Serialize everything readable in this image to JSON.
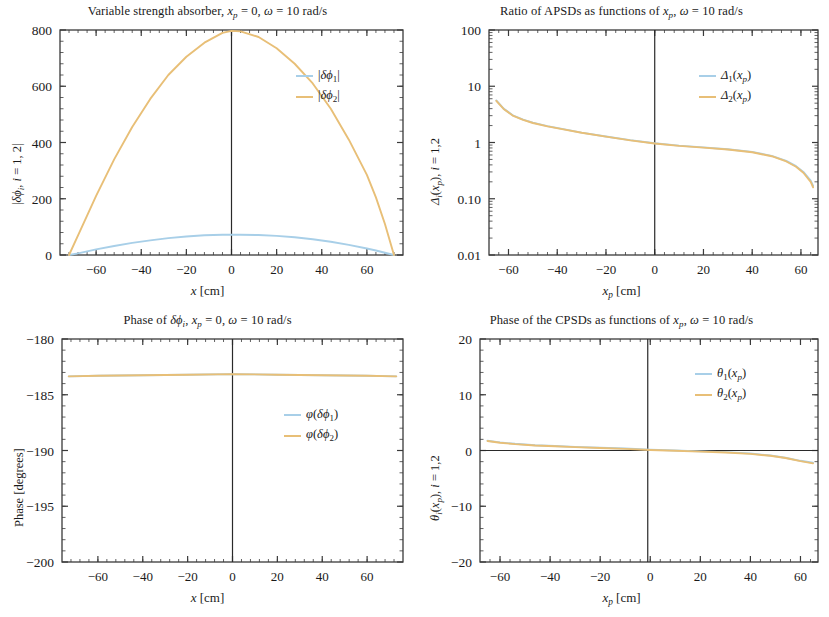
{
  "figure": {
    "kind": "four-panel scientific line plot figure",
    "colors": {
      "series1": "#a8cfe8",
      "series2": "#e8bf77",
      "axis": "#3a3a3a",
      "background": "#ffffff"
    }
  },
  "panels": {
    "top_left": {
      "title_parts": {
        "main": "Variable strength absorber, ",
        "xp": "x",
        "xp_sub": "p",
        "eq1": " = 0, ",
        "omega": "ω",
        "eq2": " = 10 rad/s"
      },
      "title_text": "Variable strength absorber, x_p = 0, ω = 10 rad/s",
      "ylabel_text": "|δφ_i, i = 1, 2|",
      "xlabel_text": "x [cm]",
      "legend": [
        "|δφ₁|",
        "|δφ₂|"
      ]
    },
    "top_right": {
      "title_text": "Ratio of APSDs as functions of x_p, ω = 10 rad/s",
      "ylabel_text": "Δ_i(x_p), i = 1,2",
      "xlabel_text": "x_p [cm]",
      "legend": [
        "Δ₁(x_p)",
        "Δ₂(x_p)"
      ]
    },
    "bottom_left": {
      "title_text": "Phase of δφ_i, x_p = 0, ω = 10 rad/s",
      "ylabel_text": "Phase [degrees]",
      "xlabel_text": "x [cm]",
      "legend": [
        "φ(δφ₁)",
        "φ(δφ₂)"
      ]
    },
    "bottom_right": {
      "title_text": "Phase of the CPSDs as functions of x_p, ω = 10 rad/s",
      "ylabel_text": "θ_i(x_p), i = 1,2",
      "xlabel_text": "x_p [cm]",
      "legend": [
        "θ₁(x_p)",
        "θ₂(x_p)"
      ]
    }
  },
  "chart_data": [
    {
      "id": "top_left",
      "type": "line",
      "title": "Variable strength absorber, x_p = 0, ω = 10 rad/s",
      "xlabel": "x [cm]",
      "ylabel": "|δφ_i, i = 1, 2|",
      "xlim": [
        -76,
        76
      ],
      "ylim": [
        0,
        800
      ],
      "xticks": [
        -60,
        -40,
        -20,
        0,
        20,
        40,
        60
      ],
      "yticks": [
        0,
        200,
        400,
        600,
        800
      ],
      "yscale": "linear",
      "grid": false,
      "legend_position": "upper-right-inside",
      "vertical_reference_line_x": 0,
      "series": [
        {
          "name": "|δφ₁|",
          "color": "#a8cfe8",
          "x": [
            -72,
            -68,
            -64,
            -60,
            -52,
            -44,
            -36,
            -28,
            -20,
            -12,
            -4,
            0,
            4,
            12,
            20,
            28,
            36,
            44,
            52,
            60,
            64,
            68,
            72
          ],
          "values": [
            0,
            6,
            13,
            20,
            32,
            43,
            52,
            60,
            66,
            70,
            72,
            72,
            72,
            71,
            68,
            63,
            56,
            47,
            36,
            23,
            16,
            8,
            0
          ]
        },
        {
          "name": "|δφ₂|",
          "color": "#e8bf77",
          "x": [
            -72,
            -68,
            -64,
            -60,
            -52,
            -44,
            -36,
            -28,
            -20,
            -12,
            -4,
            0,
            4,
            12,
            20,
            28,
            36,
            44,
            52,
            60,
            64,
            68,
            72
          ],
          "values": [
            0,
            70,
            140,
            210,
            340,
            455,
            555,
            640,
            705,
            755,
            790,
            797,
            795,
            775,
            735,
            680,
            610,
            520,
            410,
            285,
            205,
            110,
            0
          ]
        }
      ]
    },
    {
      "id": "top_right",
      "type": "line",
      "title": "Ratio of APSDs as functions of x_p, ω = 10 rad/s",
      "xlabel": "x_p [cm]",
      "ylabel": "Δ_i(x_p), i = 1,2",
      "xlim": [
        -68,
        67
      ],
      "ylim": [
        0.01,
        100
      ],
      "xticks": [
        -60,
        -40,
        -20,
        0,
        20,
        40,
        60
      ],
      "yticks": [
        0.01,
        0.1,
        1,
        10,
        100
      ],
      "ytick_labels": [
        "0.01",
        "0.10",
        "1",
        "10",
        "100"
      ],
      "yscale": "log",
      "grid": false,
      "legend_position": "upper-right-inside",
      "vertical_reference_line_x": 0,
      "series": [
        {
          "name": "Δ₁(x_p)",
          "color": "#a8cfe8",
          "x": [
            -65,
            -62,
            -58,
            -54,
            -50,
            -44,
            -38,
            -30,
            -20,
            -10,
            0,
            10,
            20,
            30,
            40,
            48,
            54,
            58,
            61,
            64,
            65
          ],
          "values": [
            5.6,
            4.0,
            3.0,
            2.55,
            2.25,
            1.95,
            1.75,
            1.5,
            1.28,
            1.1,
            0.97,
            0.88,
            0.82,
            0.76,
            0.68,
            0.58,
            0.47,
            0.38,
            0.3,
            0.21,
            0.17
          ]
        },
        {
          "name": "Δ₂(x_p)",
          "color": "#e8bf77",
          "x": [
            -65,
            -62,
            -58,
            -54,
            -50,
            -44,
            -38,
            -30,
            -20,
            -10,
            0,
            10,
            20,
            30,
            40,
            48,
            54,
            58,
            61,
            64,
            65
          ],
          "values": [
            5.5,
            3.95,
            2.97,
            2.52,
            2.22,
            1.93,
            1.73,
            1.49,
            1.27,
            1.09,
            0.96,
            0.87,
            0.81,
            0.75,
            0.67,
            0.57,
            0.46,
            0.37,
            0.29,
            0.2,
            0.16
          ]
        }
      ]
    },
    {
      "id": "bottom_left",
      "type": "line",
      "title": "Phase of δφ_i, x_p = 0, ω = 10 rad/s",
      "xlabel": "x [cm]",
      "ylabel": "Phase [degrees]",
      "xlim": [
        -76,
        76
      ],
      "ylim": [
        -200,
        -180
      ],
      "xticks": [
        -60,
        -40,
        -20,
        0,
        20,
        40,
        60
      ],
      "yticks": [
        -200,
        -195,
        -190,
        -185,
        -180
      ],
      "yscale": "linear",
      "grid": false,
      "legend_position": "mid-right-inside",
      "vertical_reference_line_x": 0,
      "series": [
        {
          "name": "φ(δφ₁)",
          "color": "#a8cfe8",
          "x": [
            -73,
            -60,
            -40,
            -20,
            0,
            20,
            40,
            60,
            73
          ],
          "values": [
            -183.35,
            -183.3,
            -183.25,
            -183.2,
            -183.15,
            -183.2,
            -183.25,
            -183.3,
            -183.35
          ]
        },
        {
          "name": "φ(δφ₂)",
          "color": "#e8bf77",
          "x": [
            -73,
            -60,
            -40,
            -20,
            0,
            20,
            40,
            60,
            73
          ],
          "values": [
            -183.35,
            -183.3,
            -183.25,
            -183.2,
            -183.15,
            -183.2,
            -183.25,
            -183.3,
            -183.35
          ]
        }
      ]
    },
    {
      "id": "bottom_right",
      "type": "line",
      "title": "Phase of the CPSDs as functions of x_p, ω = 10 rad/s",
      "xlabel": "x_p [cm]",
      "ylabel": "θ_i(x_p), i = 1,2",
      "xlim": [
        -68,
        67
      ],
      "ylim": [
        -20,
        20
      ],
      "xticks": [
        -60,
        -40,
        -20,
        0,
        20,
        40,
        60
      ],
      "yticks": [
        -20,
        -10,
        0,
        10,
        20
      ],
      "yscale": "linear",
      "grid": false,
      "legend_position": "upper-right-inside",
      "vertical_reference_line_x": -1,
      "horizontal_reference_line_y": 0,
      "series": [
        {
          "name": "θ₁(x_p)",
          "color": "#a8cfe8",
          "x": [
            -65,
            -60,
            -54,
            -46,
            -38,
            -30,
            -20,
            -10,
            0,
            10,
            20,
            30,
            40,
            48,
            54,
            60,
            65
          ],
          "values": [
            1.75,
            1.45,
            1.2,
            0.95,
            0.8,
            0.65,
            0.5,
            0.35,
            0.15,
            0.0,
            -0.15,
            -0.3,
            -0.55,
            -0.9,
            -1.3,
            -1.85,
            -2.2
          ]
        },
        {
          "name": "θ₂(x_p)",
          "color": "#e8bf77",
          "x": [
            -65,
            -60,
            -54,
            -46,
            -38,
            -30,
            -20,
            -10,
            0,
            10,
            20,
            30,
            40,
            48,
            54,
            60,
            65
          ],
          "values": [
            1.7,
            1.4,
            1.15,
            0.9,
            0.75,
            0.6,
            0.45,
            0.3,
            0.1,
            -0.05,
            -0.2,
            -0.35,
            -0.6,
            -0.95,
            -1.35,
            -1.9,
            -2.3
          ]
        }
      ]
    }
  ]
}
